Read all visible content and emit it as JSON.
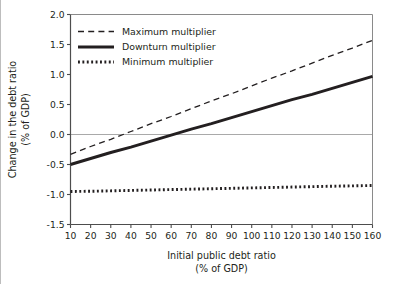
{
  "chart_data": {
    "type": "line",
    "title": "",
    "xlabel": "Initial public debt ratio",
    "xlabel_sub": "(% of GDP)",
    "ylabel": "Change in the debt ratio",
    "ylabel_sub": "(% of GDP)",
    "xlim": [
      10,
      160
    ],
    "ylim": [
      -1.5,
      2.0
    ],
    "xticks": [
      10,
      20,
      30,
      40,
      50,
      60,
      70,
      80,
      90,
      100,
      110,
      120,
      130,
      140,
      150,
      160
    ],
    "xticklabels": [
      "10",
      "20",
      "30",
      "40",
      "50",
      "60",
      "70",
      "80",
      "90",
      "100",
      "110",
      "120",
      "130",
      "140",
      "150",
      "160"
    ],
    "yticks": [
      2.0,
      1.5,
      1.0,
      0.5,
      0.0,
      -0.5,
      -1.0,
      -1.5
    ],
    "yticklabels": [
      "2.0",
      "1.5",
      "1.0",
      "0.5",
      "0.0",
      "-0.5",
      "-1.0",
      "-1.5"
    ],
    "grid": false,
    "zero_line": true,
    "legend_position": "top-left",
    "x": [
      10,
      20,
      30,
      40,
      50,
      60,
      70,
      80,
      90,
      100,
      110,
      120,
      130,
      140,
      150,
      160
    ],
    "series": [
      {
        "name": "Maximum multiplier",
        "style": "dashed",
        "color": "#231f20",
        "values": [
          -0.33,
          -0.2,
          -0.08,
          0.05,
          0.18,
          0.3,
          0.43,
          0.56,
          0.68,
          0.81,
          0.94,
          1.06,
          1.19,
          1.32,
          1.44,
          1.57
        ]
      },
      {
        "name": "Downturn multiplier",
        "style": "solid",
        "color": "#231f20",
        "values": [
          -0.5,
          -0.4,
          -0.3,
          -0.21,
          -0.11,
          -0.01,
          0.09,
          0.18,
          0.28,
          0.38,
          0.48,
          0.58,
          0.67,
          0.77,
          0.87,
          0.97
        ]
      },
      {
        "name": "Minimum multiplier",
        "style": "dotted",
        "color": "#231f20",
        "values": [
          -0.95,
          -0.946,
          -0.939,
          -0.932,
          -0.925,
          -0.918,
          -0.911,
          -0.904,
          -0.897,
          -0.89,
          -0.883,
          -0.876,
          -0.869,
          -0.862,
          -0.856,
          -0.85
        ]
      }
    ]
  },
  "legend": {
    "items": [
      {
        "label": "Maximum multiplier"
      },
      {
        "label": "Downturn multiplier"
      },
      {
        "label": "Minimum multiplier"
      }
    ]
  }
}
